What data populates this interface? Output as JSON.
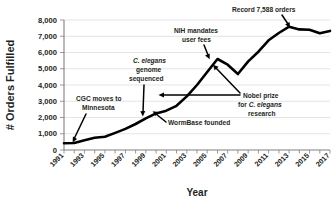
{
  "chart_data": {
    "type": "line",
    "title": "",
    "xlabel": "Year",
    "ylabel": "# Orders Fulfilled",
    "ylim": [
      0,
      8000
    ],
    "xlim": [
      1991,
      2017
    ],
    "grid": true,
    "legend": "none",
    "ytick_labels": [
      "8,000",
      "7,000",
      "6,000",
      "5,000",
      "4,000",
      "3,000",
      "2,000",
      "1,000",
      "0"
    ],
    "ytick_values": [
      8000,
      7000,
      6000,
      5000,
      4000,
      3000,
      2000,
      1000,
      0
    ],
    "xtick_labels": [
      "1991",
      "1993",
      "1995",
      "1997",
      "1999",
      "2001",
      "2003",
      "2005",
      "2007",
      "2009",
      "2011",
      "2013",
      "2015",
      "2017"
    ],
    "xtick_values": [
      1991,
      1993,
      1995,
      1997,
      1999,
      2001,
      2003,
      2005,
      2007,
      2009,
      2011,
      2013,
      2015,
      2017
    ],
    "x": [
      1991,
      1992,
      1993,
      1994,
      1995,
      1996,
      1997,
      1998,
      1999,
      2000,
      2001,
      2002,
      2003,
      2004,
      2005,
      2006,
      2007,
      2008,
      2009,
      2010,
      2011,
      2012,
      2013,
      2014,
      2015,
      2016,
      2017
    ],
    "values": [
      420,
      430,
      600,
      760,
      820,
      1050,
      1300,
      1600,
      1950,
      2250,
      2420,
      2720,
      3300,
      4000,
      4800,
      5600,
      5250,
      4680,
      5450,
      6050,
      6750,
      7200,
      7588,
      7420,
      7400,
      7180,
      7330
    ],
    "annotations": [
      {
        "id": "cgc-minnesota",
        "lines": [
          "CGC moves to",
          "Minnesota"
        ],
        "target_year": 1992,
        "target_value": 430
      },
      {
        "id": "genome-sequenced",
        "lines": [
          "C. elegans",
          "genome",
          "sequenced"
        ],
        "italic_lines": [
          0
        ],
        "target_year": 1998,
        "target_value": 1600
      },
      {
        "id": "wormbase-founded",
        "lines": [
          "WormBase founded"
        ],
        "target_year": 2000,
        "target_value": 2250
      },
      {
        "id": "nih-user-fees",
        "lines": [
          "NIH mandates",
          "user fees"
        ],
        "target_year": 2006,
        "target_value": 5600
      },
      {
        "id": "nobel-prize",
        "lines": [
          "Nobel prize",
          "for C. elegans",
          "research"
        ],
        "italic_lines": [
          1
        ],
        "target_year": 2002,
        "target_value": 2720
      },
      {
        "id": "record-orders",
        "lines": [
          "Record 7,588 orders"
        ],
        "target_year": 2013,
        "target_value": 7588
      }
    ]
  },
  "labels": {
    "y_axis_title": "# Orders Fulfilled",
    "x_axis_title": "Year",
    "anno_cgc_line1": "CGC moves to",
    "anno_cgc_line2": "Minnesota",
    "anno_genome_line1": "C. elegans",
    "anno_genome_line2": "genome",
    "anno_genome_line3": "sequenced",
    "anno_wormbase": "WormBase founded",
    "anno_nih_line1": "NIH mandates",
    "anno_nih_line2": "user fees",
    "anno_nobel_line1": "Nobel prize",
    "anno_nobel_line2_pre": "for ",
    "anno_nobel_line2_it": "C. elegans",
    "anno_nobel_line3": "research",
    "anno_record": "Record 7,588 orders"
  },
  "colors": {
    "line": "#000000",
    "grid": "#d9d9d9",
    "axis": "#808080",
    "text": "#231f20",
    "background": "#ffffff"
  }
}
